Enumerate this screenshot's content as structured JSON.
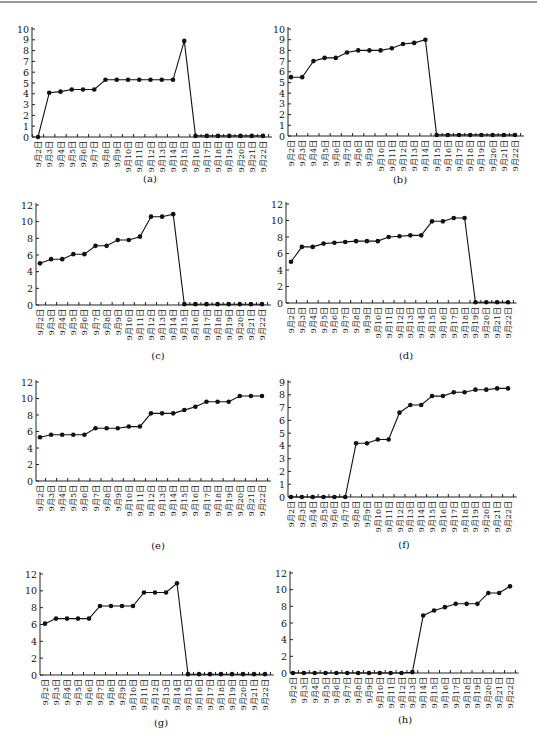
{
  "categories": [
    "9月2日",
    "9月3日",
    "9月4日",
    "9月5日",
    "9月6日",
    "9月7日",
    "9月8日",
    "9月9日",
    "9月10日",
    "9月11日",
    "9月12日",
    "9月13日",
    "9月14日",
    "9月15日",
    "9月16日",
    "9月17日",
    "9月18日",
    "9月19日",
    "9月20日",
    "9月21日",
    "9月22日"
  ],
  "panels": [
    {
      "label": "(a)"
    },
    {
      "label": "(b)"
    },
    {
      "label": "(c)"
    },
    {
      "label": "(d)"
    },
    {
      "label": "(e)"
    },
    {
      "label": "(f)"
    },
    {
      "label": "(g)"
    },
    {
      "label": "(h)"
    }
  ],
  "chart_data": [
    {
      "type": "line",
      "title": "(a)",
      "xlabel": "",
      "ylabel": "",
      "ylim": [
        0,
        10
      ],
      "yticks": [
        0,
        1,
        2,
        3,
        4,
        5,
        6,
        7,
        8,
        9,
        10
      ],
      "grid": false,
      "categories": [
        "9月2日",
        "9月3日",
        "9月4日",
        "9月5日",
        "9月6日",
        "9月7日",
        "9月8日",
        "9月9日",
        "9月10日",
        "9月11日",
        "9月12日",
        "9月13日",
        "9月14日",
        "9月15日",
        "9月16日",
        "9月17日",
        "9月18日",
        "9月19日",
        "9月20日",
        "9月21日",
        "9月22日"
      ],
      "values": [
        0,
        4.1,
        4.2,
        4.4,
        4.4,
        4.4,
        5.3,
        5.3,
        5.3,
        5.3,
        5.3,
        5.3,
        5.3,
        8.9,
        0.1,
        0.1,
        0.1,
        0.1,
        0.1,
        0.1,
        0.1
      ]
    },
    {
      "type": "line",
      "title": "(b)",
      "xlabel": "",
      "ylabel": "",
      "ylim": [
        0,
        10
      ],
      "yticks": [
        0,
        1,
        2,
        3,
        4,
        5,
        6,
        7,
        8,
        9,
        10
      ],
      "grid": false,
      "categories": [
        "9月2日",
        "9月3日",
        "9月4日",
        "9月5日",
        "9月6日",
        "9月7日",
        "9月8日",
        "9月9日",
        "9月10日",
        "9月11日",
        "9月12日",
        "9月13日",
        "9月14日",
        "9月15日",
        "9月16日",
        "9月17日",
        "9月18日",
        "9月19日",
        "9月20日",
        "9月21日",
        "9月22日"
      ],
      "values": [
        5.5,
        5.5,
        7.0,
        7.3,
        7.3,
        7.8,
        8.0,
        8.0,
        8.0,
        8.2,
        8.6,
        8.7,
        9.0,
        0.1,
        0.1,
        0.1,
        0.1,
        0.1,
        0.1,
        0.1,
        0.1
      ]
    },
    {
      "type": "line",
      "title": "(c)",
      "xlabel": "",
      "ylabel": "",
      "ylim": [
        0,
        12
      ],
      "yticks": [
        0,
        2,
        4,
        6,
        8,
        10,
        12
      ],
      "grid": false,
      "categories": [
        "9月2日",
        "9月3日",
        "9月4日",
        "9月5日",
        "9月6日",
        "9月7日",
        "9月8日",
        "9月9日",
        "9月10日",
        "9月11日",
        "9月12日",
        "9月13日",
        "9月14日",
        "9月15日",
        "9月16日",
        "9月17日",
        "9月18日",
        "9月19日",
        "9月20日",
        "9月21日",
        "9月22日"
      ],
      "values": [
        5.0,
        5.5,
        5.5,
        6.1,
        6.1,
        7.1,
        7.1,
        7.8,
        7.8,
        8.2,
        10.6,
        10.6,
        10.9,
        0.1,
        0.1,
        0.1,
        0.1,
        0.1,
        0.1,
        0.1,
        0.1
      ]
    },
    {
      "type": "line",
      "title": "(d)",
      "xlabel": "",
      "ylabel": "",
      "ylim": [
        0,
        12
      ],
      "yticks": [
        0,
        2,
        4,
        6,
        8,
        10,
        12
      ],
      "grid": false,
      "categories": [
        "9月2日",
        "9月3日",
        "9月4日",
        "9月5日",
        "9月6日",
        "9月7日",
        "9月8日",
        "9月9日",
        "9月10日",
        "9月11日",
        "9月12日",
        "9月13日",
        "9月14日",
        "9月15日",
        "9月16日",
        "9月17日",
        "9月18日",
        "9月19日",
        "9月20日",
        "9月21日",
        "9月22日"
      ],
      "values": [
        5.0,
        6.8,
        6.8,
        7.2,
        7.3,
        7.4,
        7.5,
        7.5,
        7.5,
        8.0,
        8.1,
        8.2,
        8.2,
        9.9,
        9.9,
        10.3,
        10.3,
        0.1,
        0.1,
        0.1,
        0.1
      ]
    },
    {
      "type": "line",
      "title": "(e)",
      "xlabel": "",
      "ylabel": "",
      "ylim": [
        0,
        12
      ],
      "yticks": [
        0,
        2,
        4,
        6,
        8,
        10,
        12
      ],
      "grid": false,
      "categories": [
        "9月2日",
        "9月3日",
        "9月4日",
        "9月5日",
        "9月6日",
        "9月7日",
        "9月8日",
        "9月9日",
        "9月10日",
        "9月11日",
        "9月12日",
        "9月13日",
        "9月14日",
        "9月15日",
        "9月16日",
        "9月17日",
        "9月18日",
        "9月19日",
        "9月20日",
        "9月21日",
        "9月22日"
      ],
      "values": [
        5.3,
        5.6,
        5.6,
        5.6,
        5.6,
        6.4,
        6.4,
        6.4,
        6.6,
        6.6,
        8.2,
        8.2,
        8.2,
        8.6,
        9.0,
        9.6,
        9.6,
        9.6,
        10.3,
        10.3,
        10.3
      ]
    },
    {
      "type": "line",
      "title": "(f)",
      "xlabel": "",
      "ylabel": "",
      "ylim": [
        0,
        9
      ],
      "yticks": [
        0,
        1,
        2,
        3,
        4,
        5,
        6,
        7,
        8,
        9
      ],
      "grid": false,
      "categories": [
        "9月2日",
        "9月3日",
        "9月4日",
        "9月5日",
        "9月6日",
        "9月7日",
        "9月8日",
        "9月9日",
        "9月10日",
        "9月11日",
        "9月12日",
        "9月13日",
        "9月14日",
        "9月15日",
        "9月16日",
        "9月17日",
        "9月18日",
        "9月19日",
        "9月20日",
        "9月21日",
        "9月22日"
      ],
      "values": [
        0,
        0,
        0,
        0,
        0,
        0,
        4.2,
        4.2,
        4.5,
        4.5,
        6.6,
        7.2,
        7.2,
        7.9,
        7.9,
        8.2,
        8.2,
        8.4,
        8.4,
        8.5,
        8.5
      ]
    },
    {
      "type": "line",
      "title": "(g)",
      "xlabel": "",
      "ylabel": "",
      "ylim": [
        0,
        12
      ],
      "yticks": [
        0,
        2,
        4,
        6,
        8,
        10,
        12
      ],
      "grid": false,
      "categories": [
        "9月2日",
        "9月3日",
        "9月4日",
        "9月5日",
        "9月6日",
        "9月7日",
        "9月8日",
        "9月9日",
        "9月10日",
        "9月11日",
        "9月12日",
        "9月13日",
        "9月14日",
        "9月15日",
        "9月16日",
        "9月17日",
        "9月18日",
        "9月19日",
        "9月20日",
        "9月21日",
        "9月22日"
      ],
      "values": [
        6.1,
        6.7,
        6.7,
        6.7,
        6.7,
        8.2,
        8.2,
        8.2,
        8.2,
        9.8,
        9.8,
        9.8,
        10.9,
        0.1,
        0.1,
        0.1,
        0.1,
        0.1,
        0.1,
        0.1,
        0.1
      ]
    },
    {
      "type": "line",
      "title": "(h)",
      "xlabel": "",
      "ylabel": "",
      "ylim": [
        0,
        12
      ],
      "yticks": [
        0,
        2,
        4,
        6,
        8,
        10,
        12
      ],
      "grid": false,
      "categories": [
        "9月2日",
        "9月3日",
        "9月4日",
        "9月5日",
        "9月6日",
        "9月7日",
        "9月8日",
        "9月9日",
        "9月10日",
        "9月11日",
        "9月12日",
        "9月13日",
        "9月14日",
        "9月15日",
        "9月16日",
        "9月17日",
        "9月18日",
        "9月19日",
        "9月20日",
        "9月21日",
        "9月22日"
      ],
      "values": [
        0,
        0,
        0,
        0,
        0,
        0,
        0,
        0,
        0,
        0,
        0,
        0.1,
        6.9,
        7.5,
        7.9,
        8.3,
        8.3,
        8.3,
        9.6,
        9.6,
        10.4
      ]
    }
  ]
}
